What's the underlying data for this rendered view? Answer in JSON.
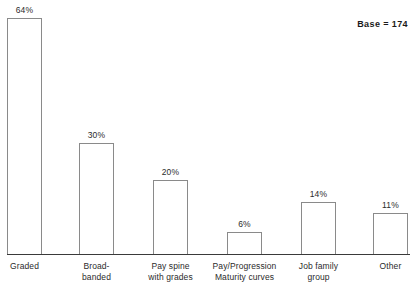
{
  "annotation": {
    "base_label": "Base = 174"
  },
  "chart_data": {
    "type": "bar",
    "title": "",
    "subtitle": "",
    "xlabel": "",
    "ylabel": "",
    "ylim": [
      0,
      70
    ],
    "grid": false,
    "legend": "none",
    "axis": {
      "x_axis_visible": true,
      "y_axis_visible": false,
      "tick_labels": []
    },
    "value_suffix": "%",
    "categories": [
      "Graded",
      "Broad-\nbanded",
      "Pay spine\nwith grades",
      "Pay/Progression\nMaturity curves",
      "Job family\ngroup",
      "Other"
    ],
    "values": [
      64,
      30,
      20,
      6,
      14,
      11
    ],
    "value_labels": [
      "64%",
      "30%",
      "20%",
      "6%",
      "14%",
      "11%"
    ],
    "bar_style": {
      "fill": "#ffffff",
      "stroke": "#8a8a8a"
    },
    "geometry": {
      "baseline_y": 254,
      "px_per_unit": 3.69,
      "bar_width": 35,
      "bar_left": [
        7,
        79,
        153,
        227,
        301,
        373
      ]
    }
  }
}
